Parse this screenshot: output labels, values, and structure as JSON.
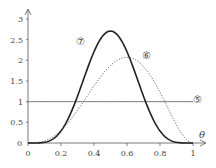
{
  "chart_data": {
    "type": "line",
    "title": "",
    "xlabel": "θ",
    "ylabel": "",
    "xlim": [
      0,
      1
    ],
    "ylim": [
      0,
      3
    ],
    "grid": false,
    "x_ticks": [
      "0",
      "0.2",
      "0.4",
      "0.6",
      "0.8",
      "1"
    ],
    "y_ticks": [
      "0",
      "0.5",
      "1",
      "1.5",
      "2",
      "2.5",
      "3"
    ],
    "series": [
      {
        "name": "⑤",
        "style": "solid-thin",
        "formula": "1",
        "x": [
          0,
          1
        ],
        "values": [
          1,
          1
        ]
      },
      {
        "name": "⑥",
        "style": "dotted",
        "formula": "60θ^3(1-θ)^2",
        "x": [
          0,
          0.1,
          0.2,
          0.3,
          0.4,
          0.5,
          0.6,
          0.7,
          0.8,
          0.9,
          1.0
        ],
        "values": [
          0,
          0.049,
          0.307,
          0.794,
          1.382,
          1.875,
          2.074,
          1.852,
          1.229,
          0.437,
          0
        ]
      },
      {
        "name": "⑦",
        "style": "solid-bold",
        "formula": "2772θ^5(1-θ)^5",
        "x": [
          0,
          0.1,
          0.2,
          0.3,
          0.4,
          0.5,
          0.6,
          0.7,
          0.8,
          0.9,
          1.0
        ],
        "values": [
          0,
          0.016,
          0.291,
          1.129,
          2.207,
          2.707,
          2.207,
          1.129,
          0.291,
          0.016,
          0
        ]
      }
    ],
    "labels": [
      {
        "text": "⑤",
        "x": 1.03,
        "y": 1.05
      },
      {
        "text": "⑥",
        "x": 0.72,
        "y": 2.1
      },
      {
        "text": "⑦",
        "x": 0.32,
        "y": 2.45
      }
    ]
  }
}
